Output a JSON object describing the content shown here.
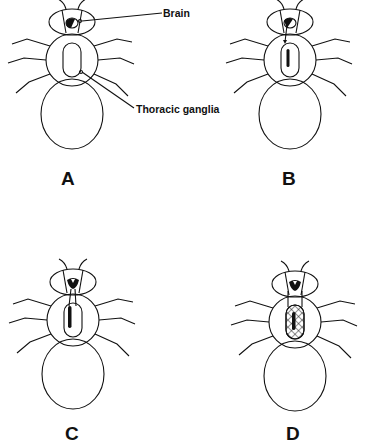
{
  "diagram": {
    "callouts": {
      "brain": "Brain",
      "thoracic": "Thoracic ganglia"
    },
    "panels": [
      {
        "id": "A",
        "label": "A",
        "cx": 72,
        "cy": 0,
        "state": "brain-only"
      },
      {
        "id": "B",
        "label": "B",
        "cx": 292,
        "cy": 0,
        "state": "single-axon-to-thorax"
      },
      {
        "id": "C",
        "label": "C",
        "cx": 76,
        "cy": 255,
        "state": "two-axons"
      },
      {
        "id": "D",
        "label": "D",
        "cx": 294,
        "cy": 255,
        "state": "two-axons-hatched-ganglia"
      }
    ],
    "colors": {
      "line": "#111111",
      "background": "#ffffff"
    }
  }
}
